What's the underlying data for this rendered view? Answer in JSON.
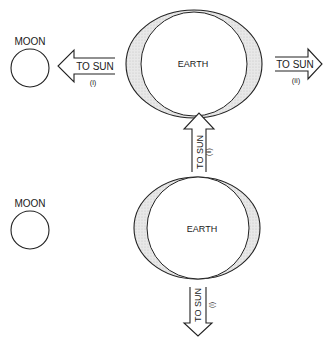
{
  "diagram": {
    "colors": {
      "stroke": "#222222",
      "tidal_bulge_fill": "#e6e6e6",
      "background": "#ffffff"
    },
    "top_panel": {
      "moon_label": "MOON",
      "earth_label": "EARTH",
      "arrow_left": {
        "label": "TO SUN",
        "sublabel": "(i)",
        "direction": "left"
      },
      "arrow_right": {
        "label": "TO SUN",
        "sublabel": "(ii)",
        "direction": "right"
      }
    },
    "middle": {
      "arrow_up": {
        "label": "TO SUN",
        "sublabel": "(ii)",
        "direction": "up"
      }
    },
    "bottom_panel": {
      "moon_label": "MOON",
      "earth_label": "EARTH",
      "arrow_down": {
        "label": "TO SUN",
        "sublabel": "(i)",
        "direction": "down"
      }
    }
  }
}
